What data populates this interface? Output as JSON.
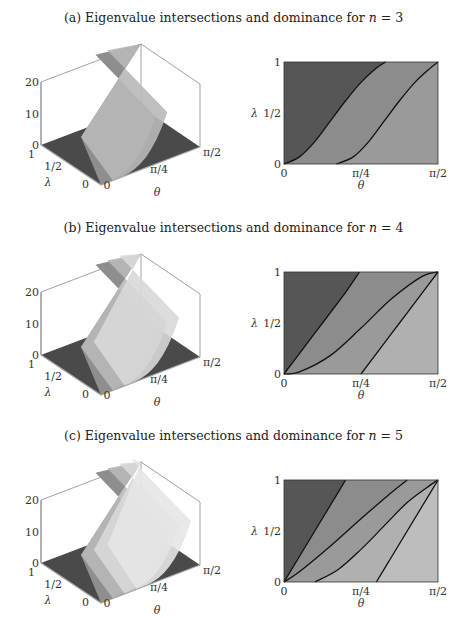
{
  "panels": [
    {
      "id": "a",
      "title_prefix": "(a) Eigenvalue intersections and dominance for ",
      "title_var": "n",
      "title_suffix": " = 3",
      "n": 3
    },
    {
      "id": "b",
      "title_prefix": "(b) Eigenvalue intersections and dominance for ",
      "title_var": "n",
      "title_suffix": " = 4",
      "n": 4
    },
    {
      "id": "c",
      "title_prefix": "(c) Eigenvalue intersections and dominance for ",
      "title_var": "n",
      "title_suffix": " = 5",
      "n": 5
    }
  ],
  "axes3d": {
    "z_ticks": [
      "0",
      "10",
      "20"
    ],
    "lambda_ticks": [
      "1",
      "1/2",
      "0"
    ],
    "theta_ticks": [
      "0",
      "π/4",
      "π/2"
    ],
    "lambda_label": "λ",
    "theta_label": "θ"
  },
  "axes2d": {
    "y_ticks": [
      "0",
      "1/2",
      "1"
    ],
    "x_ticks": [
      "0",
      "π/4",
      "π/2"
    ],
    "ylabel": "λ",
    "xlabel": "θ"
  },
  "colors": {
    "region_1": "#565656",
    "region_2": "#8c8c8c",
    "region_3": "#9a9a9a",
    "region_4": "#b0b0b0",
    "region_5": "#bdbdbd",
    "floor": "#4a4a4a",
    "surface_mid": "#8e8e8e",
    "surface_light": "#b8b8b8",
    "surface_lighter": "#d8d8d8",
    "curve": "#111111",
    "frame": "#888888"
  },
  "chart_data": [
    {
      "type": "heatmap",
      "title": "(a) Eigenvalue intersections and dominance for n = 3",
      "xlabel": "θ",
      "ylabel": "λ",
      "xlim": [
        0,
        1.5708
      ],
      "ylim": [
        0,
        1
      ],
      "x_tick_labels": [
        "0",
        "π/4",
        "π/2"
      ],
      "y_tick_labels": [
        "0",
        "1/2",
        "1"
      ],
      "boundary_curves": [
        {
          "name": "boundary 1",
          "x_frac": [
            0,
            0.1,
            0.2,
            0.3,
            0.4,
            0.5,
            0.6,
            0.66
          ],
          "y": [
            0,
            0.07,
            0.22,
            0.42,
            0.62,
            0.8,
            0.94,
            1.0
          ]
        },
        {
          "name": "boundary 2",
          "x_frac": [
            0.34,
            0.45,
            0.55,
            0.65,
            0.75,
            0.85,
            0.95,
            1.0
          ],
          "y": [
            0,
            0.07,
            0.22,
            0.42,
            0.62,
            0.8,
            0.94,
            1.0
          ]
        }
      ],
      "regions": 3,
      "surface3d": {
        "z_ticks": [
          0,
          10,
          20
        ],
        "lambda_ticks": [
          "0",
          "1/2",
          "1"
        ],
        "theta_ticks": [
          "0",
          "π/4",
          "π/2"
        ]
      }
    },
    {
      "type": "heatmap",
      "title": "(b) Eigenvalue intersections and dominance for n = 4",
      "xlabel": "θ",
      "ylabel": "λ",
      "xlim": [
        0,
        1.5708
      ],
      "ylim": [
        0,
        1
      ],
      "x_tick_labels": [
        "0",
        "π/4",
        "π/2"
      ],
      "y_tick_labels": [
        "0",
        "1/2",
        "1"
      ],
      "boundary_curves": [
        {
          "name": "boundary 1",
          "x_frac": [
            0,
            0.1,
            0.2,
            0.3,
            0.4,
            0.49
          ],
          "y": [
            0,
            0.2,
            0.4,
            0.6,
            0.8,
            1.0
          ]
        },
        {
          "name": "boundary 2",
          "x_frac": [
            0,
            0.1,
            0.3,
            0.5,
            0.7,
            0.9,
            1.0
          ],
          "y": [
            0,
            0.02,
            0.18,
            0.45,
            0.74,
            0.96,
            1.0
          ]
        },
        {
          "name": "boundary 3",
          "x_frac": [
            0.5,
            0.6,
            0.7,
            0.8,
            0.9,
            1.0
          ],
          "y": [
            0,
            0.2,
            0.4,
            0.6,
            0.8,
            1.0
          ]
        }
      ],
      "regions": 4,
      "surface3d": {
        "z_ticks": [
          0,
          10,
          20
        ],
        "lambda_ticks": [
          "0",
          "1/2",
          "1"
        ],
        "theta_ticks": [
          "0",
          "π/4",
          "π/2"
        ]
      }
    },
    {
      "type": "heatmap",
      "title": "(c) Eigenvalue intersections and dominance for n = 5",
      "xlabel": "θ",
      "ylabel": "λ",
      "xlim": [
        0,
        1.5708
      ],
      "ylim": [
        0,
        1
      ],
      "x_tick_labels": [
        "0",
        "π/4",
        "π/2"
      ],
      "y_tick_labels": [
        "0",
        "1/2",
        "1"
      ],
      "boundary_curves": [
        {
          "name": "boundary 1",
          "x_frac": [
            0,
            0.1,
            0.2,
            0.3,
            0.4
          ],
          "y": [
            0,
            0.25,
            0.5,
            0.75,
            1.0
          ]
        },
        {
          "name": "boundary 2",
          "x_frac": [
            0,
            0.1,
            0.3,
            0.5,
            0.7,
            0.8
          ],
          "y": [
            0,
            0.1,
            0.35,
            0.62,
            0.88,
            1.0
          ]
        },
        {
          "name": "boundary 3",
          "x_frac": [
            0.2,
            0.35,
            0.5,
            0.65,
            0.8,
            0.95,
            1.0
          ],
          "y": [
            0,
            0.12,
            0.32,
            0.55,
            0.78,
            0.95,
            1.0
          ]
        },
        {
          "name": "boundary 4",
          "x_frac": [
            0.6,
            0.7,
            0.8,
            0.9,
            1.0
          ],
          "y": [
            0,
            0.25,
            0.5,
            0.75,
            1.0
          ]
        }
      ],
      "regions": 5,
      "surface3d": {
        "z_ticks": [
          0,
          10,
          20
        ],
        "lambda_ticks": [
          "0",
          "1/2",
          "1"
        ],
        "theta_ticks": [
          "0",
          "π/4",
          "π/2"
        ]
      }
    }
  ]
}
